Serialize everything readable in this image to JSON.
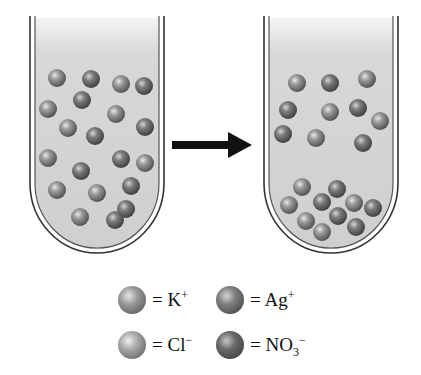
{
  "figure": {
    "colors": {
      "solution": "#d0d0d0",
      "tube_outline": "#333333",
      "arrow": "#111111",
      "K_plus": "#8a8a8a",
      "Ag_plus": "#6f6f6f",
      "Cl_minus": "#a0a0a0",
      "NO3_minus": "#5e5e5e"
    },
    "left_tube": {
      "label": "before",
      "particles": [
        [
          57,
          78
        ],
        [
          91,
          79
        ],
        [
          121,
          84
        ],
        [
          144,
          86
        ],
        [
          48,
          109
        ],
        [
          82,
          100
        ],
        [
          116,
          114
        ],
        [
          145,
          127
        ],
        [
          68,
          128
        ],
        [
          95,
          136
        ],
        [
          48,
          158
        ],
        [
          121,
          159
        ],
        [
          145,
          163
        ],
        [
          81,
          171
        ],
        [
          57,
          190
        ],
        [
          131,
          186
        ],
        [
          97,
          193
        ],
        [
          126,
          209
        ],
        [
          80,
          217
        ],
        [
          115,
          220
        ]
      ]
    },
    "right_tube": {
      "label": "after",
      "particles": [
        [
          297,
          83
        ],
        [
          330,
          83
        ],
        [
          367,
          79
        ],
        [
          288,
          110
        ],
        [
          330,
          112
        ],
        [
          358,
          108
        ],
        [
          380,
          121
        ],
        [
          283,
          134
        ],
        [
          316,
          138
        ],
        [
          363,
          143
        ],
        [
          302,
          187
        ],
        [
          337,
          189
        ],
        [
          289,
          205
        ],
        [
          322,
          202
        ],
        [
          354,
          203
        ],
        [
          373,
          208
        ],
        [
          306,
          221
        ],
        [
          338,
          216
        ],
        [
          322,
          232
        ],
        [
          356,
          227
        ]
      ]
    },
    "arrow": {
      "direction": "right"
    }
  },
  "legend": {
    "items": [
      {
        "key": "K_plus",
        "eq": "= K",
        "sup": "+",
        "sub": ""
      },
      {
        "key": "Ag_plus",
        "eq": "= Ag",
        "sup": "+",
        "sub": ""
      },
      {
        "key": "Cl_minus",
        "eq": "= Cl",
        "sup": "−",
        "sub": ""
      },
      {
        "key": "NO3_minus",
        "eq": "= NO",
        "sub": "3",
        "sup": "−"
      }
    ]
  }
}
